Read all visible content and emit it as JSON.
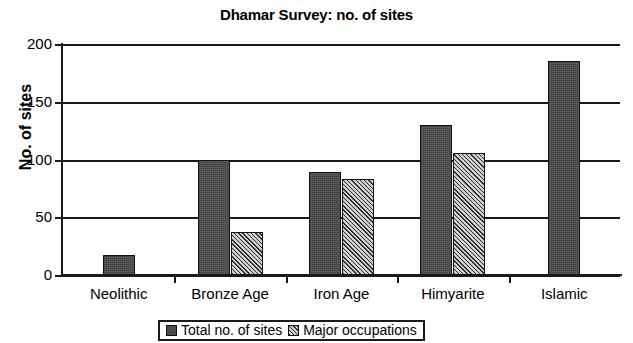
{
  "chart_data": {
    "type": "bar",
    "title": "Dhamar Survey: no. of sites",
    "xlabel": "",
    "ylabel": "No. of sites",
    "categories": [
      "Neolithic",
      "Bronze Age",
      "Iron Age",
      "Himyarite",
      "Islamic"
    ],
    "series": [
      {
        "name": "Total no. of sites",
        "values": [
          17,
          100,
          89,
          130,
          185
        ],
        "pattern": "solid",
        "color": "#4d4d4d"
      },
      {
        "name": "Major occupations",
        "values": [
          null,
          37,
          83,
          106,
          null
        ],
        "pattern": "hatched",
        "color": "#8a8a8a"
      }
    ],
    "ylim": [
      0,
      200
    ],
    "yticks": [
      0,
      50,
      100,
      150,
      200
    ],
    "ytick_labels": [
      "0",
      "50",
      "100",
      "150",
      "200"
    ],
    "grid": true,
    "grid_axis": "y",
    "legend_position": "bottom",
    "legend_entries": [
      "Total no. of sites",
      "Major occupations"
    ]
  }
}
